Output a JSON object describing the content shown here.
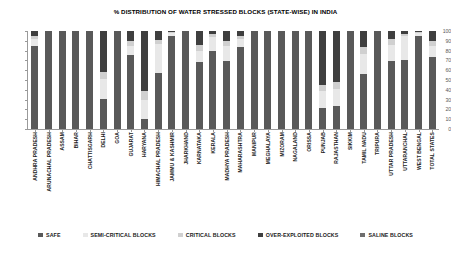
{
  "chart_data": {
    "type": "bar",
    "subtype": "stacked-column-100",
    "title": "% DISTRIBUTION OF WATER STRESSED BLOCKS (STATE-WISE) IN INDIA",
    "xlabel": "",
    "ylabel": "",
    "ylim": [
      0,
      100
    ],
    "yticks": [
      0,
      10,
      20,
      30,
      40,
      50,
      60,
      70,
      80,
      90,
      100
    ],
    "grid": false,
    "legend_position": "bottom",
    "categories": [
      "ANDHRA PRADESH",
      "ARUNACHAL PRADESH",
      "ASSAM",
      "BIHAR",
      "CHATTISGARH",
      "DELHI",
      "GOA",
      "GUJARAT",
      "HARYANA",
      "HIMACHAL PRADESH",
      "JAMMU & KASHMIR",
      "JHARKHAND",
      "KARNATAKA",
      "KERALA",
      "MADHYA PRADESH",
      "MAHARASHTRA",
      "MANIPUR",
      "MEGHALAYA",
      "MIZORAM",
      "NAGALAND",
      "ORISSA",
      "PUNJAB",
      "RAJASTHAN",
      "SIKKIM",
      "TAMIL NADU",
      "TRIPURA",
      "UTTAR PRADESH",
      "UTTARANCHAL",
      "WEST BENGAL",
      "TOTAL STATES"
    ],
    "series": [
      {
        "name": "SAFE",
        "color": "#595959",
        "values": [
          85,
          100,
          100,
          100,
          100,
          31,
          100,
          76,
          10,
          57,
          95,
          100,
          68,
          80,
          69,
          84,
          100,
          100,
          100,
          100,
          100,
          21,
          23,
          100,
          56,
          100,
          69,
          70,
          95,
          73
        ]
      },
      {
        "name": "SEMI-CRITICAL BLOCKS",
        "color": "#e8e8e8",
        "values": [
          7,
          0,
          0,
          0,
          0,
          20,
          0,
          9,
          20,
          30,
          3,
          0,
          12,
          14,
          16,
          8,
          0,
          0,
          0,
          0,
          0,
          18,
          18,
          0,
          21,
          0,
          17,
          25,
          3,
          12
        ]
      },
      {
        "name": "CRITICAL BLOCKS",
        "color": "#d0d0d0",
        "values": [
          3,
          0,
          0,
          0,
          0,
          7,
          0,
          5,
          9,
          4,
          1,
          0,
          6,
          3,
          5,
          3,
          0,
          0,
          0,
          0,
          0,
          6,
          7,
          0,
          7,
          0,
          6,
          2,
          1,
          5
        ]
      },
      {
        "name": "OVER-EXPLOITED BLOCKS",
        "color": "#3f3f3f",
        "values": [
          5,
          0,
          0,
          0,
          0,
          42,
          0,
          10,
          61,
          9,
          1,
          0,
          14,
          3,
          10,
          5,
          0,
          0,
          0,
          0,
          0,
          55,
          52,
          0,
          16,
          0,
          8,
          3,
          1,
          10
        ]
      },
      {
        "name": "SALINE BLOCKS",
        "color": "#6e6e6e",
        "values": [
          0,
          0,
          0,
          0,
          0,
          0,
          0,
          0,
          0,
          0,
          0,
          0,
          0,
          0,
          0,
          0,
          0,
          0,
          0,
          0,
          0,
          0,
          0,
          0,
          0,
          0,
          0,
          0,
          0,
          0
        ]
      }
    ]
  },
  "legend": {
    "items": [
      {
        "label": "SAFE",
        "color": "#595959"
      },
      {
        "label": "SEMI-CRITICAL BLOCKS",
        "color": "#e8e8e8"
      },
      {
        "label": "CRITICAL BLOCKS",
        "color": "#d0d0d0"
      },
      {
        "label": "OVER-EXPLOITED BLOCKS",
        "color": "#3f3f3f"
      },
      {
        "label": "SALINE BLOCKS",
        "color": "#6e6e6e"
      }
    ]
  }
}
